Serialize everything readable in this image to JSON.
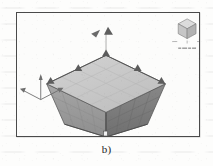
{
  "figure": {
    "caption": "b)",
    "kind": "3d-cad-fea-viewport-screenshot"
  },
  "viewport": {
    "background_color": "#fcfcfb",
    "border_color": "#4a4a4a"
  },
  "model": {
    "name": "tapered-box-frustum",
    "description": "Tapered rectangular frustum, wide square top face, narrow square base",
    "top_face_color": "#c8c8c8",
    "left_face_color": "#9a9a9a",
    "right_face_color": "#7c7c7c",
    "edge_color": "#5a5a5a",
    "mesh_visible": true,
    "mesh_color": "#b0b0b0"
  },
  "annotations": {
    "corner_markers_label": "corner restraint markers",
    "corner_marker_count": 4,
    "base_pin_label": "base fixity pin",
    "top_leader_label": "top load leader"
  },
  "axis_triad": {
    "name": "coordinate-axis-triad",
    "color": "#6e6e6e",
    "axes": [
      {
        "id": "x",
        "label": ""
      },
      {
        "id": "y",
        "label": ""
      },
      {
        "id": "z",
        "label": ""
      }
    ]
  },
  "view_cube": {
    "name": "view-navigation-cube",
    "top_face_label": "",
    "left_face_label": "",
    "right_face_label": "",
    "cube_color": "#d2d2d2",
    "status_text": "",
    "has_compass_ticks": true
  }
}
